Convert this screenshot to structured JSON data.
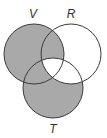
{
  "diagram": {
    "type": "venn",
    "colors": {
      "shade": "#a9a9a9",
      "stroke": "#3a3a3a",
      "background": "#ffffff"
    },
    "sets": [
      {
        "id": "V",
        "label": "V",
        "cx": 34,
        "cy": 54,
        "r": 30,
        "label_x": 33,
        "label_y": 18
      },
      {
        "id": "R",
        "label": "R",
        "cx": 71,
        "cy": 54,
        "r": 30,
        "label_x": 71,
        "label_y": 18
      },
      {
        "id": "T",
        "label": "T",
        "cx": 53,
        "cy": 88,
        "r": 30,
        "label_x": 53,
        "label_y": 133
      }
    ],
    "shaded_regions": [
      "V only",
      "V∩R not T",
      "V∩T not R",
      "T only"
    ],
    "unshaded_regions": [
      "R only",
      "R∩T not V",
      "V∩R∩T"
    ]
  }
}
